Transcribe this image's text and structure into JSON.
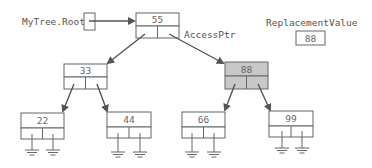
{
  "labels": {
    "root": "MyTree.Root",
    "access_ptr": "AccessPtr",
    "replacement_label": "ReplacementValue",
    "replacement_value": "88"
  },
  "nodes": {
    "n55": "55",
    "n33": "33",
    "n88": "88",
    "n22": "22",
    "n44": "44",
    "n66": "66",
    "n99": "99"
  },
  "colors": {
    "highlight_node": "#c8c8c8",
    "arrow": "#555555"
  }
}
